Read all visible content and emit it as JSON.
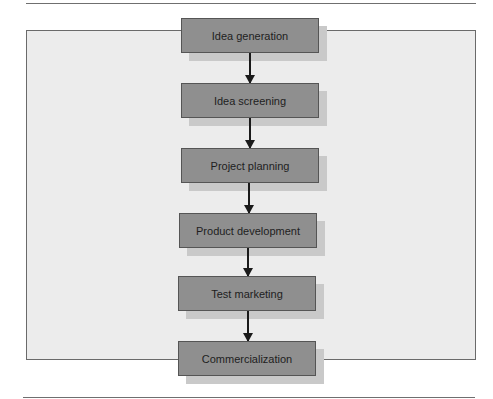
{
  "diagram": {
    "type": "flowchart",
    "direction": "top-to-bottom",
    "steps": [
      {
        "label": "Idea generation"
      },
      {
        "label": "Idea screening"
      },
      {
        "label": "Project planning"
      },
      {
        "label": "Product development"
      },
      {
        "label": "Test marketing"
      },
      {
        "label": "Commercialization"
      }
    ],
    "connections": [
      {
        "from": "Idea generation",
        "to": "Idea screening"
      },
      {
        "from": "Idea screening",
        "to": "Project planning"
      },
      {
        "from": "Project planning",
        "to": "Product development"
      },
      {
        "from": "Product development",
        "to": "Test marketing"
      },
      {
        "from": "Test marketing",
        "to": "Commercialization"
      }
    ],
    "colors": {
      "box_fill": "#8f8f8f",
      "box_border": "#555555",
      "panel_fill": "#ececec",
      "arrow": "#1a1a1a"
    }
  }
}
